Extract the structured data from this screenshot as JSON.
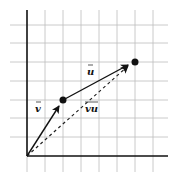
{
  "diagram": {
    "grid": {
      "origin_px": [
        27,
        156
      ],
      "spacing_px": 18.2,
      "x_lines": 8,
      "y_lines": 8,
      "line_color": "#b8b8b8",
      "axis_color": "#111111"
    },
    "points": [
      {
        "name": "point-v-end",
        "coord": [
          2,
          3
        ]
      },
      {
        "name": "point-u-end",
        "coord": [
          6,
          5
        ]
      }
    ],
    "vectors": [
      {
        "name": "vector-v",
        "label": "v",
        "from": [
          0,
          0
        ],
        "to": [
          2,
          3
        ],
        "style": "solid"
      },
      {
        "name": "vector-u",
        "label": "u",
        "from": [
          2,
          3
        ],
        "to": [
          6,
          5
        ],
        "style": "solid"
      },
      {
        "name": "vector-vu",
        "label": "vu",
        "from": [
          0,
          0
        ],
        "to": [
          6,
          5
        ],
        "style": "dashed"
      }
    ],
    "labels": {
      "v": "v",
      "u": "u",
      "vu": "vu"
    }
  }
}
